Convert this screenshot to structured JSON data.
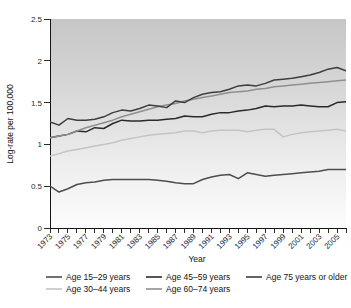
{
  "chart_data": {
    "type": "line",
    "title": "",
    "xlabel": "Year",
    "ylabel": "Log-rate per 100,000",
    "xlim": [
      1973,
      2006
    ],
    "ylim": [
      0,
      2.5
    ],
    "yticks": [
      "0",
      "0.5",
      "1",
      "1.5",
      "2",
      "2.5"
    ],
    "ytick_values": [
      0,
      0.5,
      1,
      1.5,
      2,
      2.5
    ],
    "xticks": [
      "1973",
      "1975",
      "1977",
      "1979",
      "1981",
      "1983",
      "1985",
      "1987",
      "1989",
      "1991",
      "1993",
      "1995",
      "1997",
      "1999",
      "2001",
      "2003",
      "2005"
    ],
    "xtick_values": [
      1973,
      1975,
      1977,
      1979,
      1981,
      1983,
      1985,
      1987,
      1989,
      1991,
      1993,
      1995,
      1997,
      1999,
      2001,
      2003,
      2005
    ],
    "grid": false,
    "legend_position": "bottom",
    "x": [
      1973,
      1974,
      1975,
      1976,
      1977,
      1978,
      1979,
      1980,
      1981,
      1982,
      1983,
      1984,
      1985,
      1986,
      1987,
      1988,
      1989,
      1990,
      1991,
      1992,
      1993,
      1994,
      1995,
      1996,
      1997,
      1998,
      1999,
      2000,
      2001,
      2002,
      2003,
      2004,
      2005,
      2006
    ],
    "series": [
      {
        "name": "Age 15–29 years",
        "color": "#4d4d4d",
        "values": [
          0.5,
          0.43,
          0.47,
          0.52,
          0.54,
          0.55,
          0.57,
          0.58,
          0.58,
          0.58,
          0.58,
          0.58,
          0.57,
          0.56,
          0.54,
          0.53,
          0.53,
          0.58,
          0.61,
          0.63,
          0.64,
          0.59,
          0.66,
          0.64,
          0.62,
          0.63,
          0.64,
          0.65,
          0.66,
          0.67,
          0.68,
          0.7,
          0.7,
          0.7
        ]
      },
      {
        "name": "Age 30–44 years",
        "color": "#c4c4c4",
        "values": [
          0.86,
          0.89,
          0.92,
          0.94,
          0.96,
          0.98,
          1.0,
          1.02,
          1.05,
          1.07,
          1.09,
          1.11,
          1.12,
          1.13,
          1.14,
          1.16,
          1.16,
          1.14,
          1.16,
          1.17,
          1.17,
          1.17,
          1.15,
          1.17,
          1.18,
          1.18,
          1.09,
          1.12,
          1.14,
          1.15,
          1.16,
          1.17,
          1.18,
          1.16
        ]
      },
      {
        "name": "Age 45–59 years",
        "color": "#2a2a2a",
        "values": [
          1.08,
          1.1,
          1.12,
          1.16,
          1.15,
          1.2,
          1.19,
          1.25,
          1.29,
          1.28,
          1.28,
          1.29,
          1.29,
          1.3,
          1.31,
          1.34,
          1.33,
          1.33,
          1.36,
          1.38,
          1.38,
          1.4,
          1.41,
          1.43,
          1.46,
          1.45,
          1.46,
          1.46,
          1.47,
          1.46,
          1.45,
          1.45,
          1.5,
          1.51
        ]
      },
      {
        "name": "Age 60–74 years",
        "color": "#8f8f8f",
        "values": [
          1.08,
          1.1,
          1.12,
          1.16,
          1.2,
          1.23,
          1.26,
          1.29,
          1.33,
          1.36,
          1.39,
          1.42,
          1.45,
          1.47,
          1.49,
          1.52,
          1.54,
          1.56,
          1.58,
          1.6,
          1.62,
          1.63,
          1.64,
          1.66,
          1.67,
          1.69,
          1.7,
          1.71,
          1.72,
          1.73,
          1.74,
          1.75,
          1.76,
          1.77
        ]
      },
      {
        "name": "Age 75 years or older",
        "color": "#3d3d3d",
        "values": [
          1.27,
          1.23,
          1.31,
          1.29,
          1.29,
          1.3,
          1.33,
          1.38,
          1.41,
          1.4,
          1.43,
          1.47,
          1.46,
          1.44,
          1.52,
          1.5,
          1.56,
          1.6,
          1.62,
          1.63,
          1.66,
          1.7,
          1.71,
          1.7,
          1.73,
          1.77,
          1.78,
          1.79,
          1.81,
          1.83,
          1.86,
          1.9,
          1.92,
          1.88
        ]
      }
    ]
  },
  "legend": {
    "entries": [
      {
        "label": "Age 15–29 years",
        "color": "#4d4d4d"
      },
      {
        "label": "Age 30–44 years",
        "color": "#c4c4c4"
      },
      {
        "label": "Age 45–59 years",
        "color": "#2a2a2a"
      },
      {
        "label": "Age 60–74 years",
        "color": "#8f8f8f"
      },
      {
        "label": "Age 75 years or older",
        "color": "#3d3d3d"
      }
    ]
  },
  "plot": {
    "background_top_color": "#c9c9c9",
    "background_bottom_color": "#fbfbfb",
    "axis_color": "#141414"
  }
}
